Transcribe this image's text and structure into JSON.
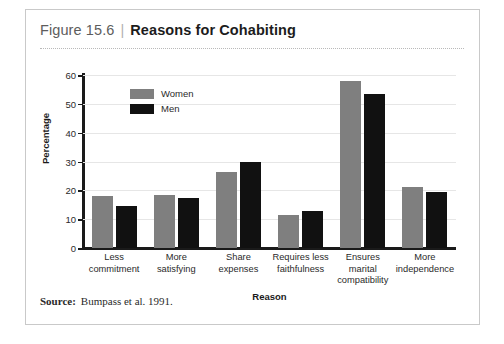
{
  "figure": {
    "number": "Figure 15.6",
    "separator": "|",
    "title": "Reasons for Cohabiting",
    "source_label": "Source:",
    "source_text": "Bumpass et al. 1991."
  },
  "colors": {
    "women": "#7f7f7f",
    "men": "#111111",
    "axis": "#1a1a1a",
    "grid": "#e6e6e6",
    "border": "#c9c9c9"
  },
  "chart_data": {
    "type": "bar",
    "title": "Reasons for Cohabiting",
    "xlabel": "Reason",
    "ylabel": "Percentage",
    "ylim": [
      0,
      60
    ],
    "yticks": [
      0,
      10,
      20,
      30,
      40,
      50,
      60
    ],
    "grid": true,
    "legend_position": "upper-left-inside",
    "categories": [
      "Less commitment",
      "More satisfying",
      "Share expenses",
      "Requires less faithfulness",
      "Ensures marital compatibility",
      "More independence"
    ],
    "category_lines": [
      [
        "Less",
        "commitment"
      ],
      [
        "More",
        "satisfying"
      ],
      [
        "Share",
        "expenses"
      ],
      [
        "Requires less",
        "faithfulness"
      ],
      [
        "Ensures",
        "marital",
        "compatibility"
      ],
      [
        "More",
        "independence"
      ]
    ],
    "series": [
      {
        "name": "Women",
        "color": "#7f7f7f",
        "values": [
          18,
          18.5,
          26.5,
          11.5,
          58,
          21
        ]
      },
      {
        "name": "Men",
        "color": "#111111",
        "values": [
          14.5,
          17.5,
          30,
          13,
          53.5,
          19.5
        ]
      }
    ]
  }
}
